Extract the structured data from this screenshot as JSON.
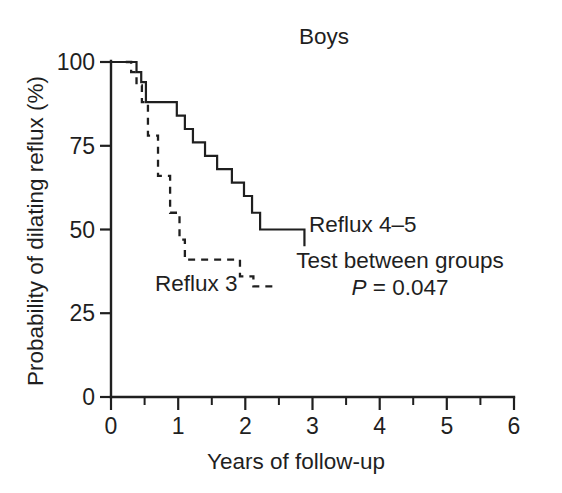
{
  "chart_data": {
    "type": "line",
    "title": "Boys",
    "xlabel": "Years of follow-up",
    "ylabel": "Probability of dilating reflux (%)",
    "xlim": [
      0,
      6
    ],
    "ylim": [
      0,
      100
    ],
    "x_ticks": [
      0,
      1,
      2,
      3,
      4,
      5,
      6
    ],
    "x_tick_labels": [
      "0",
      "1",
      "2",
      "3",
      "4",
      "5",
      "6"
    ],
    "x_minor_ticks": [
      0.5,
      1.5,
      2.5,
      3.5,
      4.5,
      5.5
    ],
    "y_ticks": [
      0,
      25,
      50,
      75,
      100
    ],
    "y_tick_labels": [
      "0",
      "25",
      "50",
      "75",
      "100"
    ],
    "grid": false,
    "legend_position": "inline-annotation",
    "series": [
      {
        "name": "Reflux 4-5",
        "label": "Reflux 4–5",
        "style": "solid",
        "step": "post",
        "x": [
          0.0,
          0.3,
          0.38,
          0.45,
          0.52,
          0.62,
          0.98,
          1.1,
          1.22,
          1.4,
          1.58,
          1.8,
          1.98,
          2.1,
          2.22,
          2.88
        ],
        "y": [
          100,
          100,
          97,
          94,
          88,
          88,
          84,
          80,
          76,
          72,
          68,
          64,
          60,
          55,
          50,
          45
        ]
      },
      {
        "name": "Reflux 3",
        "label": "Reflux 3",
        "style": "dashed",
        "step": "post",
        "x": [
          0.22,
          0.3,
          0.38,
          0.46,
          0.55,
          0.7,
          0.88,
          1.02,
          1.1,
          1.85,
          1.92,
          2.12,
          2.45
        ],
        "y": [
          100,
          97,
          93,
          88,
          78,
          66,
          55,
          47,
          41,
          41,
          36,
          33,
          33
        ]
      }
    ],
    "annotations": [
      {
        "id": "series-label-reflux45",
        "text": "Reflux 4–5",
        "x": 2.95,
        "y": 52
      },
      {
        "id": "series-label-reflux3",
        "text": "Reflux 3",
        "x": 1.02,
        "y": 29
      },
      {
        "id": "stat-test-line",
        "text": "Test between groups",
        "x": 4.35,
        "y": 39
      },
      {
        "id": "stat-p-value-prefix",
        "text": "P",
        "x": 4.35,
        "y": 31
      },
      {
        "id": "stat-p-value-rest",
        "text": " = 0.047",
        "x": 4.35,
        "y": 31
      }
    ],
    "stat_text": {
      "test_label": "Test between groups",
      "p_symbol": "P",
      "p_equals": "=",
      "p_value": "0.047",
      "p_full": "P = 0.047"
    },
    "colors": {
      "axis": "#1f1f1f",
      "curve": "#1f1f1f",
      "background": "#ffffff"
    }
  }
}
